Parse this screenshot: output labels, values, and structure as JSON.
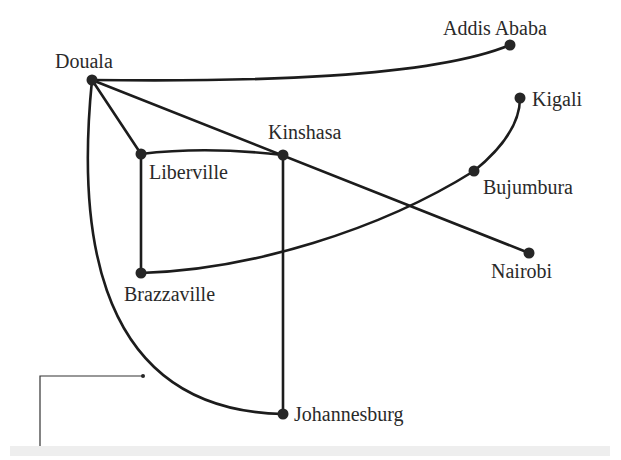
{
  "diagram": {
    "type": "network-graph",
    "nodes": [
      {
        "id": "douala",
        "label": "Douala",
        "x": 92,
        "y": 80
      },
      {
        "id": "addis",
        "label": "Addis Ababa",
        "x": 510,
        "y": 45
      },
      {
        "id": "kigali",
        "label": "Kigali",
        "x": 520,
        "y": 98
      },
      {
        "id": "libreville",
        "label": "Liberville",
        "x": 141,
        "y": 154
      },
      {
        "id": "kinshasa",
        "label": "Kinshasa",
        "x": 283,
        "y": 155
      },
      {
        "id": "bujumbura",
        "label": "Bujumbura",
        "x": 474,
        "y": 171
      },
      {
        "id": "nairobi",
        "label": "Nairobi",
        "x": 529,
        "y": 253
      },
      {
        "id": "brazzaville",
        "label": "Brazzaville",
        "x": 141,
        "y": 273
      },
      {
        "id": "johannesburg",
        "label": "Johannesburg",
        "x": 283,
        "y": 414
      }
    ],
    "edges": [
      [
        "douala",
        "addis"
      ],
      [
        "douala",
        "libreville"
      ],
      [
        "douala",
        "nairobi"
      ],
      [
        "douala",
        "johannesburg"
      ],
      [
        "libreville",
        "kinshasa"
      ],
      [
        "libreville",
        "brazzaville"
      ],
      [
        "kinshasa",
        "johannesburg"
      ],
      [
        "brazzaville",
        "bujumbura"
      ],
      [
        "bujumbura",
        "kigali"
      ]
    ]
  }
}
